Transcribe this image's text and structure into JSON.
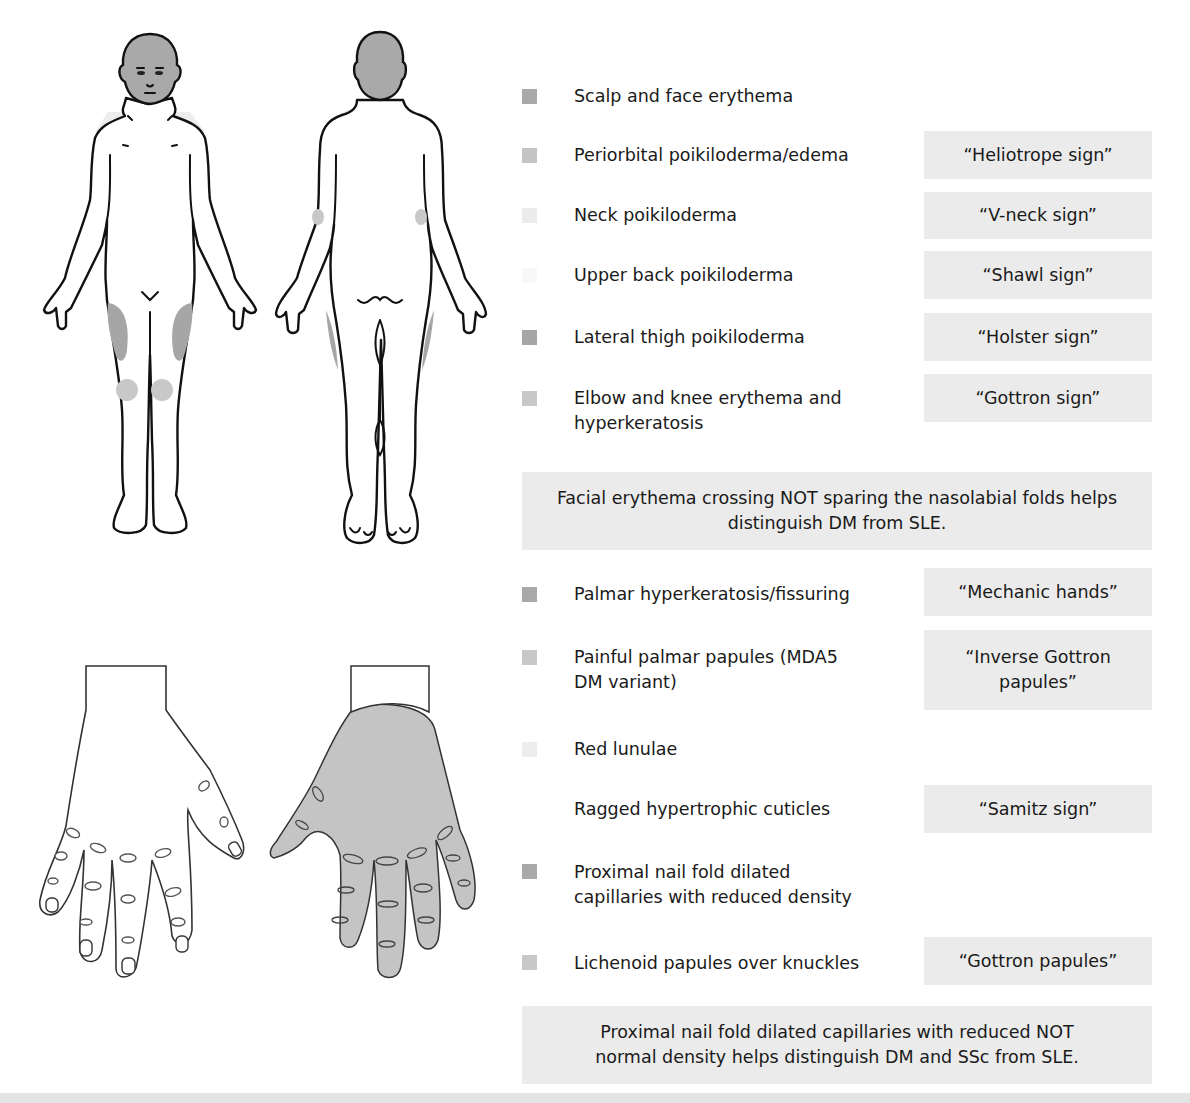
{
  "figure": {
    "views": [
      "front-body",
      "back-body",
      "dorsal-hand",
      "palmar-hand"
    ]
  },
  "colors": {
    "swatch_dark": "#a6a6a6",
    "swatch_medium": "#bdbdbd",
    "swatch_light": "#d2d2d2",
    "swatch_very_light": "#ececec",
    "swatch_faint": "#f6f6f6",
    "sign_box_bg": "#ebebeb"
  },
  "legend": {
    "items": [
      {
        "finding": "Scalp and face erythema",
        "sign": "",
        "swatch": "#a9a9a9"
      },
      {
        "finding": "Periorbital poikiloderma/edema",
        "sign": "“Heliotrope sign”",
        "swatch": "#c4c4c4"
      },
      {
        "finding": "Neck poikiloderma",
        "sign": "“V-neck sign”",
        "swatch": "#ececec"
      },
      {
        "finding": "Upper back poikiloderma",
        "sign": "“Shawl sign”",
        "swatch": "#f8f8f8"
      },
      {
        "finding": "Lateral thigh poikiloderma",
        "sign": "“Holster sign”",
        "swatch": "#a6a6a6"
      },
      {
        "finding": "Elbow and knee erythema and hyperkeratosis",
        "sign": "“Gottron sign”",
        "swatch": "#c8c8c8"
      },
      {
        "finding": "Palmar hyperkeratosis/fissuring",
        "sign": "“Mechanic hands”",
        "swatch": "#a9a9a9"
      },
      {
        "finding": "Painful palmar papules (MDA5 DM variant)",
        "sign": "“Inverse Gottron papules”",
        "swatch": "#c8c8c8"
      },
      {
        "finding": "Red lunulae",
        "sign": "",
        "swatch": "#ededed"
      },
      {
        "finding": "Ragged hypertrophic cuticles",
        "sign": "“Samitz sign”",
        "swatch": ""
      },
      {
        "finding": "Proximal nail fold dilated capillaries with reduced density",
        "sign": "",
        "swatch": "#a9a9a9"
      },
      {
        "finding": "Lichenoid papules over knuckles",
        "sign": "“Gottron papules”",
        "swatch": "#c8c8c8"
      }
    ],
    "notes": [
      "Facial erythema crossing NOT sparing the nasolabial folds helps distinguish DM from SLE.",
      "Proximal nail fold dilated capillaries with reduced NOT normal density helps distinguish DM and SSc from SLE."
    ]
  }
}
